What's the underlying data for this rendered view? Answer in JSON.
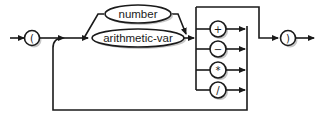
{
  "diagram": {
    "type": "syntax-railroad",
    "colors": {
      "stroke": "#1a1a1a",
      "background": "#ffffff",
      "shadow": "#c8c8c8"
    },
    "open_paren": "(",
    "close_paren": ")",
    "operands": [
      {
        "label": "number"
      },
      {
        "label": "arithmetic-var"
      }
    ],
    "operators": [
      {
        "symbol": "+"
      },
      {
        "symbol": "−"
      },
      {
        "symbol": "*"
      },
      {
        "symbol": "/"
      }
    ],
    "loop": "repeat operand-operator sequence"
  }
}
